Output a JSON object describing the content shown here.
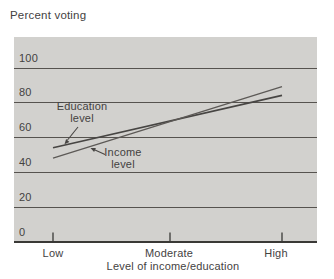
{
  "figure": {
    "background": "#ffffff",
    "plot_fill": "#d2d1ce",
    "grid_color": "#56534f",
    "axis_color": "#3a3936",
    "text_color": "#44423f"
  },
  "chart_data": {
    "type": "line",
    "title": "Percent voting",
    "xlabel": "Level of income/education",
    "x_categories": [
      "Low",
      "Moderate",
      "High"
    ],
    "y_ticks": [
      0,
      20,
      40,
      60,
      80,
      100
    ],
    "ylim": [
      0,
      117
    ],
    "grid": "on",
    "legend": "inline-annotations-with-arrows",
    "series": [
      {
        "name": "Education level",
        "x": [
          "Low",
          "High"
        ],
        "values": [
          54,
          84
        ],
        "color": "#474543"
      },
      {
        "name": "Income level",
        "x": [
          "Low",
          "High"
        ],
        "values": [
          48,
          89
        ],
        "color": "#5c5956"
      }
    ]
  }
}
